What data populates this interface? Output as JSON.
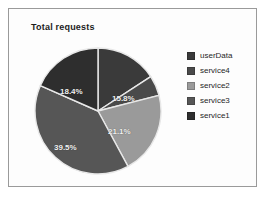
{
  "frame": {
    "border_color": "#9a9a9a",
    "background": "#fdfdfd"
  },
  "chart_data": {
    "type": "pie",
    "title": "Total requests",
    "xlabel": "",
    "ylabel": "",
    "legend_position": "right",
    "grid": false,
    "labels": [
      "userData",
      "service4",
      "service2",
      "service3",
      "service1"
    ],
    "categories": [
      "userData",
      "service4",
      "service2",
      "service3",
      "service1"
    ],
    "values": [
      15.8,
      5.2,
      21.1,
      39.5,
      18.4
    ],
    "slices": [
      {
        "label": "userData",
        "percent": 15.8,
        "percent_text": "15.8%",
        "color": "#3a3a3a",
        "start_angle": 0,
        "end_angle": 56.88,
        "label_x": 78,
        "label_y": 47
      },
      {
        "label": "service4",
        "percent": 5.2,
        "percent_text": "",
        "color": "#4a4a4a",
        "start_angle": 56.88,
        "end_angle": 75.6,
        "label_x": 0,
        "label_y": 0
      },
      {
        "label": "service2",
        "percent": 21.1,
        "percent_text": "21.1%",
        "color": "#9a9a9a",
        "start_angle": 75.6,
        "end_angle": 151.56,
        "label_x": 74,
        "label_y": 80
      },
      {
        "label": "service3",
        "percent": 39.5,
        "percent_text": "39.5%",
        "color": "#565656",
        "start_angle": 151.56,
        "end_angle": 293.76,
        "label_x": 20,
        "label_y": 96
      },
      {
        "label": "service1",
        "percent": 18.4,
        "percent_text": "18.4%",
        "color": "#2e2e2e",
        "start_angle": 293.76,
        "end_angle": 360,
        "label_x": 26,
        "label_y": 40
      }
    ],
    "separator_color": "#e8e8e8",
    "label_text_color": "#f2f2f2"
  },
  "legend": {
    "items": [
      {
        "label": "userData",
        "color": "#3a3a3a"
      },
      {
        "label": "service4",
        "color": "#4a4a4a"
      },
      {
        "label": "service2",
        "color": "#9a9a9a"
      },
      {
        "label": "service3",
        "color": "#565656"
      },
      {
        "label": "service1",
        "color": "#2e2e2e"
      }
    ]
  }
}
